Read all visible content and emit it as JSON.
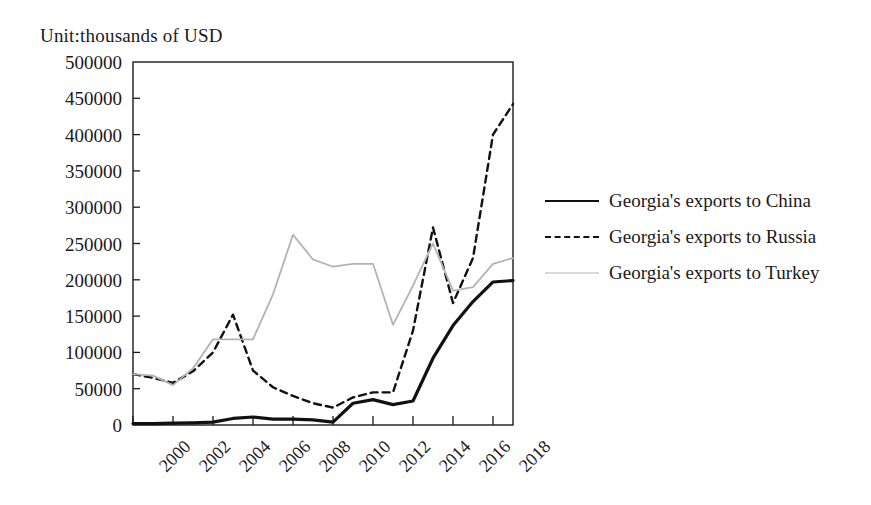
{
  "chart_data": {
    "type": "line",
    "title": "Unit:thousands of  USD",
    "xlabel": "",
    "ylabel": "",
    "ylim": [
      0,
      500000
    ],
    "ytick_values": [
      0,
      50000,
      100000,
      150000,
      200000,
      250000,
      300000,
      350000,
      400000,
      450000,
      500000
    ],
    "ytick_labels": [
      "0",
      "50000",
      "100000",
      "150000",
      "200000",
      "250000",
      "300000",
      "350000",
      "400000",
      "450000",
      "500000"
    ],
    "xlim": [
      2000,
      2019
    ],
    "xtick_values": [
      2000,
      2002,
      2004,
      2006,
      2008,
      2010,
      2012,
      2014,
      2016,
      2018
    ],
    "xtick_labels": [
      "2000",
      "2002",
      "2004",
      "2006",
      "2008",
      "2010",
      "2012",
      "2014",
      "2016",
      "2018"
    ],
    "x": [
      2000,
      2001,
      2002,
      2003,
      2004,
      2005,
      2006,
      2007,
      2008,
      2009,
      2010,
      2011,
      2012,
      2013,
      2014,
      2015,
      2016,
      2017,
      2018,
      2019
    ],
    "grid": false,
    "legend_position": "right",
    "series": [
      {
        "name": "Georgia's exports to China",
        "style": "solid",
        "color": "#111111",
        "width": 3.2,
        "values": [
          2000,
          2000,
          2500,
          3000,
          4000,
          9000,
          11000,
          8000,
          8000,
          7000,
          4000,
          30000,
          35000,
          28000,
          33000,
          92000,
          137000,
          170000,
          197000,
          199000
        ]
      },
      {
        "name": "Georgia's exports to Russia",
        "style": "dashed",
        "color": "#111111",
        "width": 2.4,
        "values": [
          70000,
          65000,
          58000,
          74000,
          100000,
          152000,
          75000,
          52000,
          40000,
          30000,
          24000,
          38000,
          45000,
          45000,
          130000,
          272000,
          168000,
          230000,
          400000,
          442000
        ]
      },
      {
        "name": "Georgia's exports to Turkey",
        "style": "solid",
        "color": "#b3b3b3",
        "width": 1.8,
        "values": [
          70000,
          68000,
          55000,
          78000,
          118000,
          118000,
          118000,
          180000,
          262000,
          228000,
          218000,
          222000,
          222000,
          138000,
          192000,
          250000,
          185000,
          190000,
          222000,
          230000
        ]
      }
    ]
  },
  "legend": {
    "items": [
      {
        "label": "Georgia's exports to China",
        "key": "line-solid-black"
      },
      {
        "label": "Georgia's exports to Russia",
        "key": "line-dashed-black"
      },
      {
        "label": "Georgia's exports to Turkey",
        "key": "line-solid-gray"
      }
    ]
  },
  "colors": {
    "axis": "#1a1a1a",
    "china": "#111111",
    "russia": "#111111",
    "turkey": "#b3b3b3",
    "background": "#ffffff"
  }
}
